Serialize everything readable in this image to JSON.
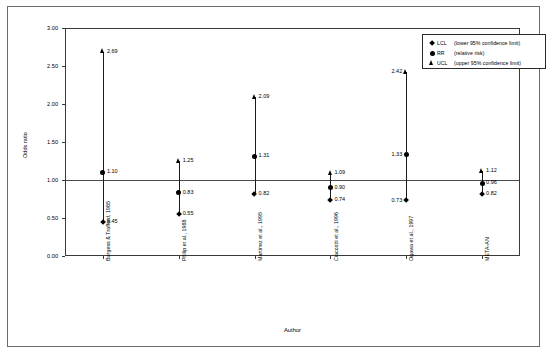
{
  "chart_data": {
    "type": "scatter",
    "title": "",
    "xlabel": "Author",
    "ylabel": "Odds ratio",
    "ylim": [
      0.0,
      3.0
    ],
    "ytick_labels": [
      "0.00",
      "0.50",
      "1.00",
      "1.50",
      "2.00",
      "2.50",
      "3.00"
    ],
    "ytick_values": [
      0.0,
      0.5,
      1.0,
      1.5,
      2.0,
      2.5,
      3.0
    ],
    "grid": false,
    "reference_line": 1.0,
    "legend_position": "top-right",
    "categories": [
      "Burgess & Trafford, 1985",
      "Philip et al., 1988",
      "Martinez et al., 1995",
      "Ciaccotti et al., 1996",
      "Ogawa et al., 1997",
      "META-AN"
    ],
    "series": [
      {
        "name": "LCL",
        "label": "LCL",
        "description": "(lower 95% confidence limit)",
        "marker": "diamond",
        "values": [
          0.45,
          0.55,
          0.82,
          0.74,
          0.73,
          0.82
        ]
      },
      {
        "name": "RR",
        "label": "RR",
        "description": "(relative risk)",
        "marker": "circle",
        "values": [
          1.1,
          0.83,
          1.31,
          0.9,
          1.33,
          0.96
        ]
      },
      {
        "name": "UCL",
        "label": "UCL",
        "description": "(upper 95% confidence limit)",
        "marker": "triangle",
        "values": [
          2.69,
          1.25,
          2.09,
          1.09,
          2.42,
          1.12
        ]
      }
    ],
    "point_labels": [
      {
        "category": "Burgess & Trafford, 1985",
        "lcl": "0.45",
        "rr": "1.10",
        "ucl": "2.69",
        "side": "right"
      },
      {
        "category": "Philip et al., 1988",
        "lcl": "0.55",
        "rr": "0.83",
        "ucl": "1.25",
        "side": "right"
      },
      {
        "category": "Martinez et al., 1995",
        "lcl": "0.82",
        "rr": "1.31",
        "ucl": "2.09",
        "side": "right"
      },
      {
        "category": "Ciaccotti et al., 1996",
        "lcl": "0.74",
        "rr": "0.90",
        "ucl": "1.09",
        "side": "right"
      },
      {
        "category": "Ogawa et al., 1997",
        "lcl": "0.73",
        "rr": "1.33",
        "ucl": "2.42",
        "side": "left"
      },
      {
        "category": "META-AN",
        "lcl": "0.82",
        "rr": "0.96",
        "ucl": "1.12",
        "side": "right"
      }
    ]
  },
  "axes": {
    "y_title": "Odds ratio",
    "x_title": "Author",
    "y_ticks": [
      "3.00",
      "2.50",
      "2.00",
      "1.50",
      "1.00",
      "0.50",
      "0.00"
    ],
    "x_ticks": [
      "Burgess & Trafford, 1985",
      "Philip et al., 1988",
      "Martinez et al., 1995",
      "Ciaccotti et al., 1996",
      "Ogawa et al., 1997",
      "META-AN"
    ]
  },
  "legend": {
    "entries": [
      {
        "abbr": "LCL",
        "text": "(lower 95% confidence limit)",
        "marker": "diamond"
      },
      {
        "abbr": "RR",
        "text": "(relative risk)",
        "marker": "circle"
      },
      {
        "abbr": "UCL",
        "text": "(upper 95% confidence limit)",
        "marker": "triangle"
      }
    ]
  },
  "colors": {
    "marker": "#000000",
    "axis": "#3a3a3a",
    "frame": "#6b6b6b",
    "background": "#ffffff"
  }
}
